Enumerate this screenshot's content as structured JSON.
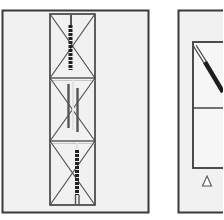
{
  "diagram": {
    "type": "structural-bracing-elevation",
    "colors": {
      "background": "#ffffff",
      "panel_fill": "#f1f1f1",
      "line": "#3a3a3a",
      "member_dark": "#2a2a2a",
      "member_light": "#d8d8d8"
    },
    "left_panel": {
      "name": "braced-column-elevation",
      "bays": 3,
      "bracing": "x-bracing",
      "note": "three stacked X-braced bays with vertical strengthening members"
    },
    "right_panel": {
      "name": "frame-with-diagonal-brace",
      "bays": 2,
      "support": "triangle-support"
    }
  }
}
